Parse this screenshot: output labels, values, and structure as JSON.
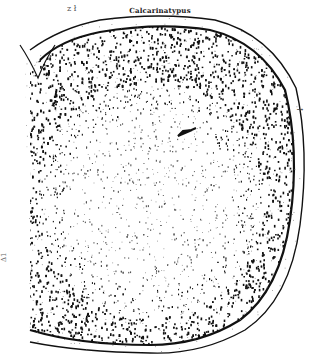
{
  "figure": {
    "title": "Calcarinatypus",
    "top_mark": "z ł",
    "right_mark": "↑",
    "left_mark": "Δ1",
    "colors": {
      "ink": "#111111",
      "paper": "#ffffff",
      "stipple_light": "#555555"
    },
    "arrow": {
      "x": 185,
      "y": 134,
      "direction": "pointing-left"
    }
  }
}
